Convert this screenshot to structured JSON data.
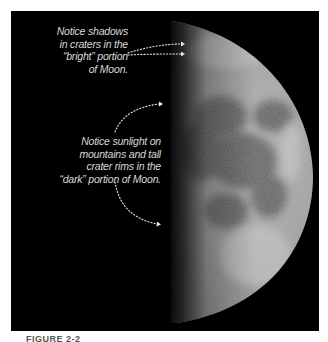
{
  "figure": {
    "callouts": [
      {
        "id": "shadows",
        "text": "Notice shadows\nin craters in the\n“bright” portion\nof Moon."
      },
      {
        "id": "sunlight",
        "text": "Notice sunlight on\nmountains and tall\ncrater rims in the\n“dark” portion of Moon."
      }
    ],
    "caption": "FIGURE 2-2"
  },
  "colors": {
    "background": "#000000",
    "page": "#ffffff",
    "callout_text": "#d9d9d9",
    "arrow": "#e6e6e6"
  }
}
